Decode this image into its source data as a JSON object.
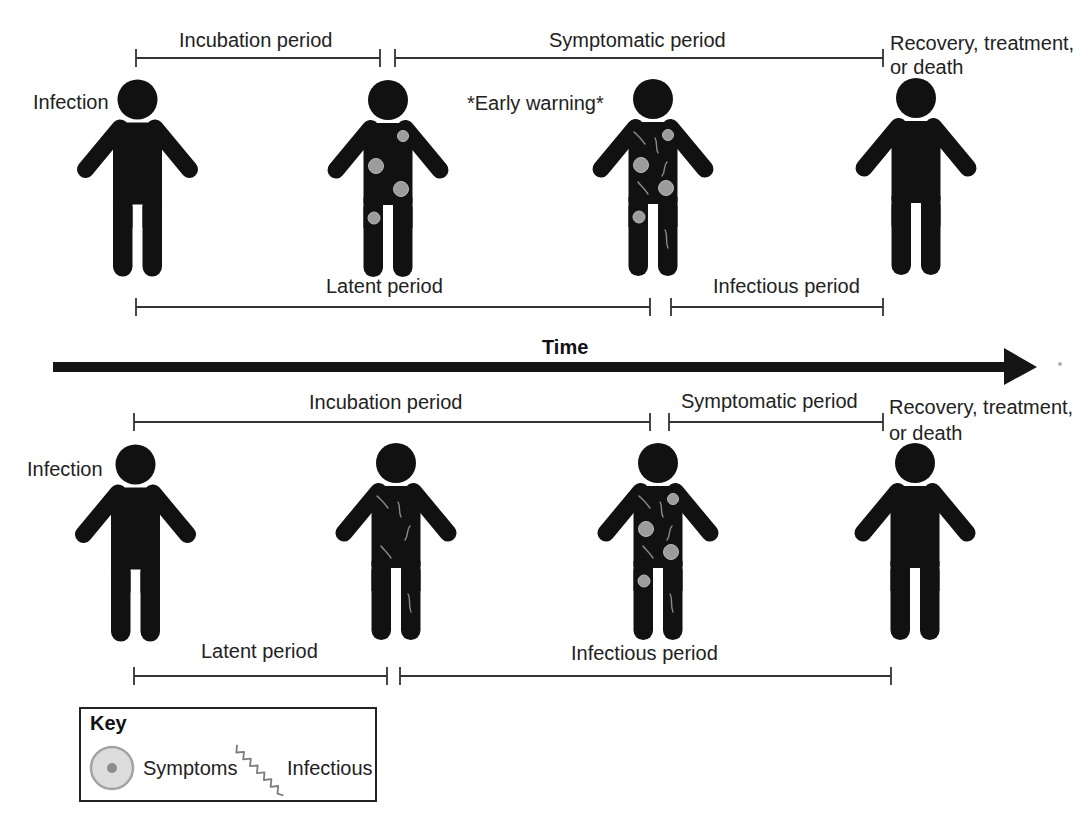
{
  "top_scenario": {
    "start_event": "Infection",
    "annotation": "*Early warning*",
    "outcome": [
      "Recovery, treatment,",
      "or death"
    ],
    "upper_periods": [
      "Incubation period",
      "Symptomatic period"
    ],
    "lower_periods": [
      "Latent period",
      "Infectious period"
    ],
    "figures": [
      {
        "position": 1,
        "markers": []
      },
      {
        "position": 2,
        "markers": [
          "symptoms"
        ]
      },
      {
        "position": 3,
        "markers": [
          "symptoms",
          "infectious"
        ]
      },
      {
        "position": 4,
        "markers": []
      }
    ]
  },
  "time_axis": {
    "label": "Time",
    "direction": "right-arrow"
  },
  "bottom_scenario": {
    "start_event": "Infection",
    "outcome": [
      "Recovery, treatment,",
      "or death"
    ],
    "upper_periods": [
      "Incubation period",
      "Symptomatic period"
    ],
    "lower_periods": [
      "Latent period",
      "Infectious period"
    ],
    "figures": [
      {
        "position": 1,
        "markers": []
      },
      {
        "position": 2,
        "markers": [
          "infectious"
        ]
      },
      {
        "position": 3,
        "markers": [
          "symptoms",
          "infectious"
        ]
      },
      {
        "position": 4,
        "markers": []
      }
    ]
  },
  "key": {
    "title": "Key",
    "items": [
      {
        "icon": "symptoms-icon",
        "label": "Symptoms"
      },
      {
        "icon": "infectious-icon",
        "label": "Infectious"
      }
    ]
  },
  "colors": {
    "figure": "#111111",
    "symptom_spot": "#9c9c9c",
    "infectious_squiggle": "#8a8a8a",
    "text": "#222222",
    "bars": "#333333"
  }
}
